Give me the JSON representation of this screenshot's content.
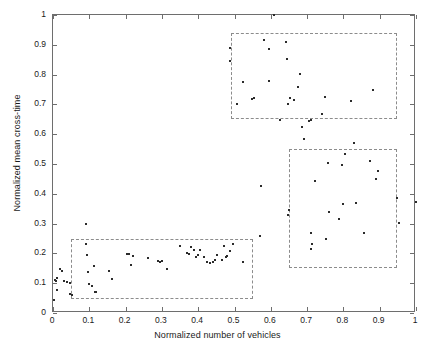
{
  "chart_data": {
    "type": "scatter",
    "title": "",
    "xlabel": "Normalized number of vehicles",
    "ylabel": "Normalized mean cross-time",
    "xlim": [
      0,
      1
    ],
    "ylim": [
      0,
      1
    ],
    "grid": false,
    "legend": null,
    "marker": "dot",
    "marker_color": "#2b2b2b",
    "xticks": [
      "0",
      "0.1",
      "0.2",
      "0.3",
      "0.4",
      "0.5",
      "0.6",
      "0.7",
      "0.8",
      "0.9",
      "1"
    ],
    "xtick_values": [
      0,
      0.1,
      0.2,
      0.3,
      0.4,
      0.5,
      0.6,
      0.7,
      0.8,
      0.9,
      1
    ],
    "yticks": [
      "0",
      "0.1",
      "0.2",
      "0.3",
      "0.4",
      "0.5",
      "0.6",
      "0.7",
      "0.8",
      "0.9",
      "1"
    ],
    "ytick_values": [
      0,
      0.1,
      0.2,
      0.3,
      0.4,
      0.5,
      0.6,
      0.7,
      0.8,
      0.9,
      1
    ],
    "points": [
      [
        0.004,
        0.045
      ],
      [
        0.006,
        0.112
      ],
      [
        0.008,
        0.108
      ],
      [
        0.01,
        0.118
      ],
      [
        0.012,
        0.078
      ],
      [
        0.018,
        0.146
      ],
      [
        0.024,
        0.141
      ],
      [
        0.031,
        0.106
      ],
      [
        0.038,
        0.104
      ],
      [
        0.046,
        0.064
      ],
      [
        0.048,
        0.101
      ],
      [
        0.052,
        0.062
      ],
      [
        0.09,
        0.3
      ],
      [
        0.092,
        0.231
      ],
      [
        0.095,
        0.193
      ],
      [
        0.097,
        0.139
      ],
      [
        0.1,
        0.097
      ],
      [
        0.108,
        0.09
      ],
      [
        0.113,
        0.158
      ],
      [
        0.116,
        0.072
      ],
      [
        0.118,
        0.071
      ],
      [
        0.155,
        0.14
      ],
      [
        0.163,
        0.115
      ],
      [
        0.203,
        0.199
      ],
      [
        0.21,
        0.197
      ],
      [
        0.215,
        0.16
      ],
      [
        0.22,
        0.192
      ],
      [
        0.263,
        0.185
      ],
      [
        0.288,
        0.173
      ],
      [
        0.296,
        0.17
      ],
      [
        0.3,
        0.175
      ],
      [
        0.313,
        0.148
      ],
      [
        0.35,
        0.224
      ],
      [
        0.368,
        0.2
      ],
      [
        0.376,
        0.199
      ],
      [
        0.38,
        0.221
      ],
      [
        0.388,
        0.213
      ],
      [
        0.395,
        0.189
      ],
      [
        0.4,
        0.196
      ],
      [
        0.405,
        0.212
      ],
      [
        0.415,
        0.189
      ],
      [
        0.425,
        0.171
      ],
      [
        0.433,
        0.168
      ],
      [
        0.44,
        0.17
      ],
      [
        0.445,
        0.179
      ],
      [
        0.452,
        0.196
      ],
      [
        0.465,
        0.178
      ],
      [
        0.47,
        0.224
      ],
      [
        0.477,
        0.189
      ],
      [
        0.48,
        0.191
      ],
      [
        0.488,
        0.207
      ],
      [
        0.497,
        0.232
      ],
      [
        0.523,
        0.171
      ],
      [
        0.573,
        0.425
      ],
      [
        0.596,
        0.885
      ],
      [
        0.61,
        1.0
      ],
      [
        0.624,
        0.647
      ],
      [
        0.58,
        0.917
      ],
      [
        0.57,
        0.258
      ],
      [
        0.487,
        0.888
      ],
      [
        0.487,
        0.846
      ],
      [
        0.523,
        0.774
      ],
      [
        0.547,
        0.718
      ],
      [
        0.508,
        0.703
      ],
      [
        0.553,
        0.721
      ],
      [
        0.596,
        0.777
      ],
      [
        0.643,
        0.911
      ],
      [
        0.646,
        0.854
      ],
      [
        0.648,
        0.7
      ],
      [
        0.652,
        0.72
      ],
      [
        0.648,
        0.33
      ],
      [
        0.651,
        0.344
      ],
      [
        0.664,
        0.716
      ],
      [
        0.676,
        0.759
      ],
      [
        0.68,
        0.802
      ],
      [
        0.687,
        0.624
      ],
      [
        0.691,
        0.585
      ],
      [
        0.704,
        0.644
      ],
      [
        0.712,
        0.214
      ],
      [
        0.713,
        0.23
      ],
      [
        0.71,
        0.269
      ],
      [
        0.722,
        0.444
      ],
      [
        0.712,
        0.648
      ],
      [
        0.74,
        0.667
      ],
      [
        0.748,
        0.724
      ],
      [
        0.753,
        0.249
      ],
      [
        0.757,
        0.504
      ],
      [
        0.759,
        0.34
      ],
      [
        0.789,
        0.315
      ],
      [
        0.795,
        0.498
      ],
      [
        0.8,
        0.366
      ],
      [
        0.805,
        0.532
      ],
      [
        0.82,
        0.71
      ],
      [
        0.828,
        0.571
      ],
      [
        0.836,
        0.369
      ],
      [
        0.858,
        0.268
      ],
      [
        0.874,
        0.511
      ],
      [
        0.881,
        0.748
      ],
      [
        0.889,
        0.449
      ],
      [
        0.896,
        0.478
      ],
      [
        0.948,
        0.385
      ],
      [
        0.952,
        0.303
      ],
      [
        0.999,
        0.372
      ]
    ],
    "cluster_boxes": [
      {
        "name": "cluster-low",
        "x0": 0.05,
        "y0": 0.047,
        "x1": 0.552,
        "y1": 0.247
      },
      {
        "name": "cluster-high-time",
        "x0": 0.49,
        "y0": 0.651,
        "x1": 0.949,
        "y1": 0.941
      },
      {
        "name": "cluster-high-volume",
        "x0": 0.651,
        "y0": 0.151,
        "x1": 0.949,
        "y1": 0.55
      }
    ]
  },
  "colors": {
    "axis": "#6e6e6e",
    "marker": "#2b2b2b",
    "box_dash": "#8c8c8c",
    "text": "#1a1a1a",
    "background": "#ffffff"
  }
}
